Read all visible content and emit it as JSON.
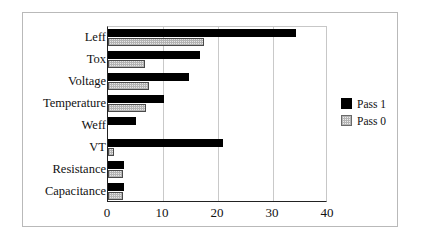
{
  "chart_data": {
    "type": "bar",
    "orientation": "horizontal",
    "title": "",
    "xlabel": "",
    "ylabel": "",
    "xlim": [
      0,
      40
    ],
    "xticks": [
      0,
      10,
      20,
      30,
      40
    ],
    "xtick_labels": [
      "0",
      "10",
      "20",
      "30",
      "40"
    ],
    "grid": "vertical",
    "legend_position": "right-outside",
    "categories": [
      "Leff",
      "Tox",
      "Voltage",
      "Temperature",
      "Weff",
      "VT",
      "Resistance",
      "Capacitance"
    ],
    "series": [
      {
        "name": "Pass 1",
        "color": "#000000",
        "values": [
          34.2,
          16.7,
          14.7,
          10.2,
          5.1,
          20.9,
          2.9,
          2.9
        ]
      },
      {
        "name": "Pass 0",
        "color": "#e6e6e6",
        "values": [
          17.5,
          6.7,
          7.5,
          6.9,
          0.0,
          1.0,
          2.7,
          2.7
        ]
      }
    ]
  },
  "legend": {
    "entries": [
      {
        "label": "Pass 1",
        "swatch": "pass1"
      },
      {
        "label": "Pass 0",
        "swatch": "pass0"
      }
    ]
  }
}
